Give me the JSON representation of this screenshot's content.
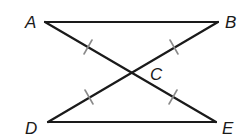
{
  "diagram": {
    "type": "geometry",
    "points": {
      "A": {
        "label": "A",
        "x": 45,
        "y": 22
      },
      "B": {
        "label": "B",
        "x": 218,
        "y": 22
      },
      "C": {
        "label": "C",
        "x": 131,
        "y": 72
      },
      "D": {
        "label": "D",
        "x": 48,
        "y": 122
      },
      "E": {
        "label": "E",
        "x": 216,
        "y": 122
      }
    },
    "segments": [
      {
        "name": "AB",
        "from": "A",
        "to": "B"
      },
      {
        "name": "DE",
        "from": "D",
        "to": "E"
      },
      {
        "name": "AE",
        "from": "A",
        "to": "E"
      },
      {
        "name": "BD",
        "from": "B",
        "to": "D"
      }
    ],
    "congruence_marks": [
      {
        "segment": "AC",
        "ticks": 1
      },
      {
        "segment": "CE",
        "ticks": 1
      },
      {
        "segment": "BC",
        "ticks": 1
      },
      {
        "segment": "CD",
        "ticks": 1
      }
    ],
    "labels": {
      "A": "A",
      "B": "B",
      "C": "C",
      "D": "D",
      "E": "E"
    },
    "colors": {
      "line": "#1a1a1a",
      "tick": "#8a8a8a",
      "background": "#ffffff"
    }
  }
}
